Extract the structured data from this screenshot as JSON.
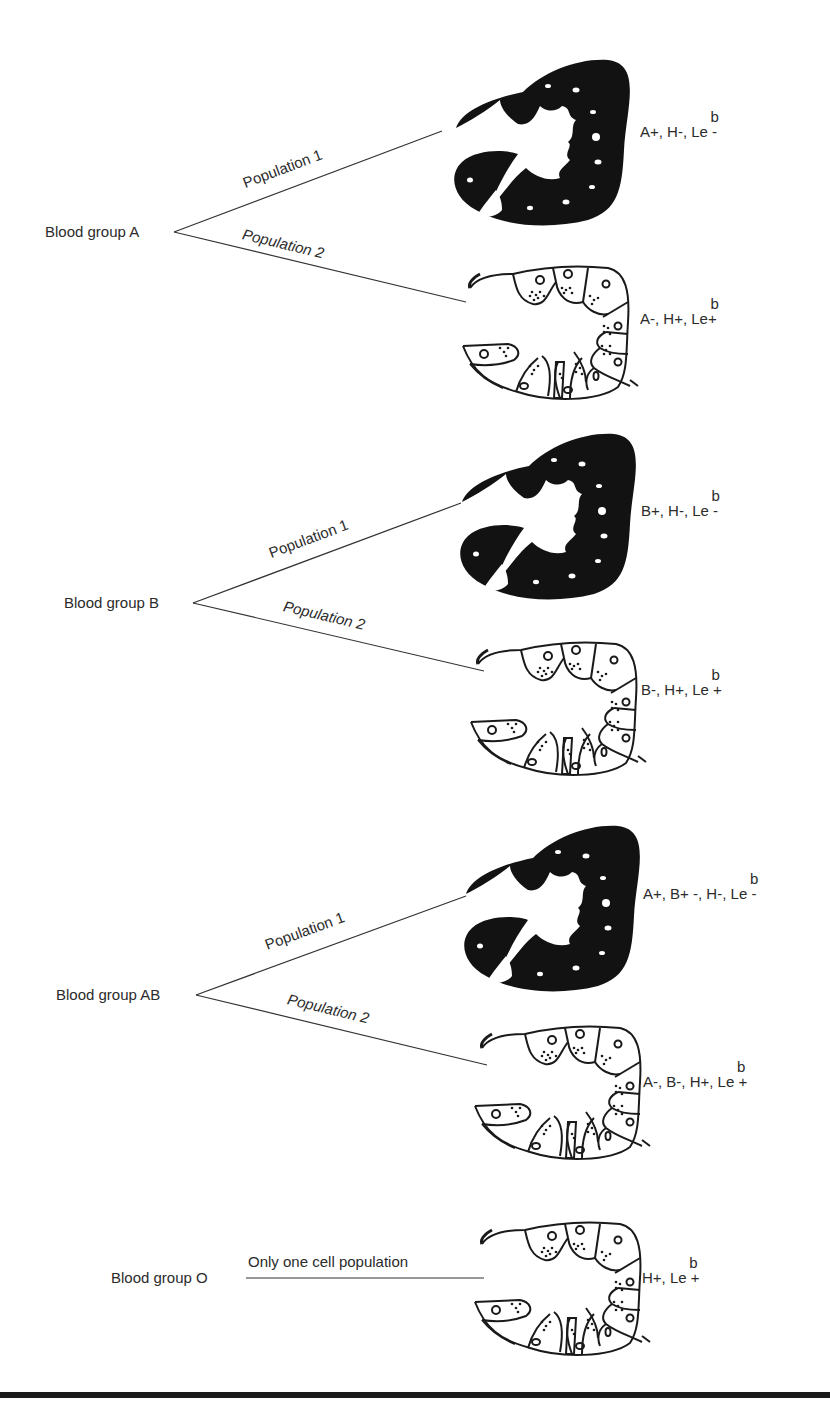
{
  "figure": {
    "groups": [
      {
        "name": "Blood group A",
        "populations": [
          {
            "label": "Population 1",
            "gland": "dark",
            "antigens": {
              "prefix": "A+, H-, L",
              "le_base": "e",
              "le_sup": "b",
              "suffix": " -"
            }
          },
          {
            "label": "Population 2",
            "gland": "light",
            "antigens": {
              "prefix": "A-, H+, L",
              "le_base": "e",
              "le_sup": "b",
              "suffix": "+"
            }
          }
        ]
      },
      {
        "name": "Blood group B",
        "populations": [
          {
            "label": "Population 1",
            "gland": "dark",
            "antigens": {
              "prefix": "B+, H-, L",
              "le_base": "e",
              "le_sup": "b",
              "suffix": " -"
            }
          },
          {
            "label": "Population 2",
            "gland": "light",
            "antigens": {
              "prefix": "B-, H+, L",
              "le_base": "e",
              "le_sup": "b",
              "suffix": " +"
            }
          }
        ]
      },
      {
        "name": "Blood group AB",
        "populations": [
          {
            "label": "Population 1",
            "gland": "dark",
            "antigens": {
              "prefix": "A+, B+ -, H-, L",
              "le_base": "e",
              "le_sup": "b",
              "suffix": " -"
            }
          },
          {
            "label": "Population 2",
            "gland": "light",
            "antigens": {
              "prefix": "A-, B-, H+, L",
              "le_base": "e",
              "le_sup": "b",
              "suffix": " +"
            }
          }
        ]
      },
      {
        "name": "Blood group O",
        "populations": [
          {
            "label": "Only one cell population",
            "gland": "light",
            "antigens": {
              "prefix": "H+, L",
              "le_base": "e",
              "le_sup": "b",
              "suffix": " +"
            }
          }
        ]
      }
    ],
    "colors": {
      "ink": "#1a1a1a",
      "text": "#2b2b2b",
      "background": "#ffffff"
    }
  }
}
